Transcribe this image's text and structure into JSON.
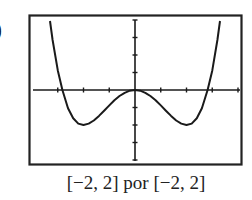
{
  "part_label": ")",
  "caption": "[−2, 2] por [−2, 2]",
  "chart_data": {
    "type": "line",
    "title": "",
    "function_shape": "y = x^4 - 2x^2",
    "xlabel": "",
    "ylabel": "",
    "xlim": [
      -2,
      2
    ],
    "ylim": [
      -2,
      2
    ],
    "x_tick_step": 0.5,
    "y_tick_step": 0.5,
    "grid": false,
    "legend": null,
    "window_text": "[−2, 2] por [−2, 2]",
    "key_points": [
      {
        "label": "x-intercept",
        "x": -1.41,
        "y": 0
      },
      {
        "label": "local minimum",
        "x": -1.0,
        "y": -1.0
      },
      {
        "label": "local maximum",
        "x": 0.0,
        "y": 0.0
      },
      {
        "label": "local minimum",
        "x": 1.0,
        "y": -1.0
      },
      {
        "label": "x-intercept",
        "x": 1.41,
        "y": 0
      }
    ],
    "series": [
      {
        "name": "f(x)",
        "x": [
          -1.65,
          -1.6,
          -1.5,
          -1.41,
          -1.3,
          -1.2,
          -1.1,
          -1.0,
          -0.9,
          -0.8,
          -0.7,
          -0.6,
          -0.5,
          -0.4,
          -0.3,
          -0.2,
          -0.1,
          0.0,
          0.1,
          0.2,
          0.3,
          0.4,
          0.5,
          0.6,
          0.7,
          0.8,
          0.9,
          1.0,
          1.1,
          1.2,
          1.3,
          1.41,
          1.5,
          1.6,
          1.65
        ],
        "values": [
          1.97,
          1.43,
          0.56,
          0.0,
          -0.52,
          -0.81,
          -0.96,
          -1.0,
          -0.96,
          -0.87,
          -0.74,
          -0.59,
          -0.44,
          -0.29,
          -0.17,
          -0.08,
          -0.02,
          0.0,
          -0.02,
          -0.08,
          -0.17,
          -0.29,
          -0.44,
          -0.59,
          -0.74,
          -0.87,
          -0.96,
          -1.0,
          -0.96,
          -0.81,
          -0.52,
          0.0,
          0.56,
          1.43,
          1.97
        ]
      }
    ]
  },
  "layout": {
    "frame": {
      "left": 29,
      "top": 15,
      "right": 242,
      "bottom": 165
    },
    "origin_px": {
      "x": 135,
      "y": 90
    },
    "px_per_unit": {
      "x": 51.5,
      "y": 35
    }
  }
}
